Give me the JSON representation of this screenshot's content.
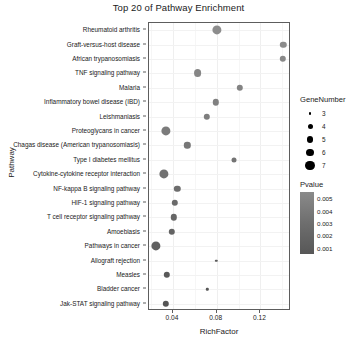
{
  "chart_data": {
    "type": "scatter",
    "title": "Top 20 of Pathway Enrichment",
    "xlabel": "RichFactor",
    "ylabel": "Pathway",
    "xlim": [
      0.018,
      0.148
    ],
    "xticks": [
      0.04,
      0.08,
      0.12
    ],
    "xticklabels": [
      "0.04",
      "0.08",
      "0.12"
    ],
    "grid": true,
    "legend_position": "right",
    "categories": [
      "Rheumatoid arthritis",
      "Graft-versus-host disease",
      "African trypanosomiasis",
      "TNF signaling pathway",
      "Malaria",
      "Inflammatory bowel disease (IBD)",
      "Leishmaniasis",
      "Proteoglycans in cancer",
      "Chagas disease (American trypanosomiasis)",
      "Type I diabetes mellitus",
      "Cytokine-cytokine receptor interaction",
      "NF-kappa B signaling pathway",
      "HIF-1 signaling pathway",
      "T cell receptor signaling pathway",
      "Amoebiasis",
      "Pathways in cancer",
      "Allograft rejection",
      "Measles",
      "Bladder cancer",
      "Jak-STAT signaling pathway"
    ],
    "points": [
      {
        "pathway": "Rheumatoid arthritis",
        "RichFactor": 0.08,
        "GeneNumber": 7,
        "Pvalue": 0.001
      },
      {
        "pathway": "Graft-versus-host disease",
        "RichFactor": 0.141,
        "GeneNumber": 5,
        "Pvalue": 0.0011
      },
      {
        "pathway": "African trypanosomiasis",
        "RichFactor": 0.1405,
        "GeneNumber": 5,
        "Pvalue": 0.0013
      },
      {
        "pathway": "TNF signaling pathway",
        "RichFactor": 0.0625,
        "GeneNumber": 6,
        "Pvalue": 0.0015
      },
      {
        "pathway": "Malaria",
        "RichFactor": 0.101,
        "GeneNumber": 5,
        "Pvalue": 0.0017
      },
      {
        "pathway": "Inflammatory bowel disease (IBD)",
        "RichFactor": 0.079,
        "GeneNumber": 5,
        "Pvalue": 0.0019
      },
      {
        "pathway": "Leishmaniasis",
        "RichFactor": 0.071,
        "GeneNumber": 5,
        "Pvalue": 0.0021
      },
      {
        "pathway": "Proteoglycans in cancer",
        "RichFactor": 0.0335,
        "GeneNumber": 7,
        "Pvalue": 0.0023
      },
      {
        "pathway": "Chagas disease (American trypanosomiasis)",
        "RichFactor": 0.053,
        "GeneNumber": 5,
        "Pvalue": 0.0026
      },
      {
        "pathway": "Type I diabetes mellitus",
        "RichFactor": 0.0955,
        "GeneNumber": 4,
        "Pvalue": 0.0028
      },
      {
        "pathway": "Cytokine-cytokine receptor interaction",
        "RichFactor": 0.032,
        "GeneNumber": 7,
        "Pvalue": 0.003
      },
      {
        "pathway": "NF-kappa B signaling pathway",
        "RichFactor": 0.044,
        "GeneNumber": 5,
        "Pvalue": 0.0033
      },
      {
        "pathway": "HIF-1 signaling pathway",
        "RichFactor": 0.0415,
        "GeneNumber": 5,
        "Pvalue": 0.0035
      },
      {
        "pathway": "T cell receptor signaling pathway",
        "RichFactor": 0.0405,
        "GeneNumber": 5,
        "Pvalue": 0.0038
      },
      {
        "pathway": "Amoebiasis",
        "RichFactor": 0.039,
        "GeneNumber": 5,
        "Pvalue": 0.004
      },
      {
        "pathway": "Pathways in cancer",
        "RichFactor": 0.0245,
        "GeneNumber": 7,
        "Pvalue": 0.0042
      },
      {
        "pathway": "Allograft rejection",
        "RichFactor": 0.0795,
        "GeneNumber": 3,
        "Pvalue": 0.0045
      },
      {
        "pathway": "Measles",
        "RichFactor": 0.0345,
        "GeneNumber": 5,
        "Pvalue": 0.0047
      },
      {
        "pathway": "Bladder cancer",
        "RichFactor": 0.0715,
        "GeneNumber": 3,
        "Pvalue": 0.0049
      },
      {
        "pathway": "Jak-STAT signaling pathway",
        "RichFactor": 0.0335,
        "GeneNumber": 5,
        "Pvalue": 0.005
      }
    ],
    "size_legend": {
      "title": "GeneNumber",
      "keys": [
        "3",
        "4",
        "5",
        "6",
        "7"
      ],
      "values": [
        3,
        4,
        5,
        6,
        7
      ]
    },
    "color_legend": {
      "title": "Pvalue",
      "ticks": [
        "0.005",
        "0.004",
        "0.003",
        "0.002",
        "0.001"
      ],
      "values": [
        0.005,
        0.004,
        0.003,
        0.002,
        0.001
      ],
      "low_color": "#555555",
      "high_color": "#8d8d8d"
    }
  }
}
